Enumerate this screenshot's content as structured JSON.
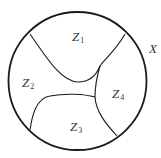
{
  "diagram": {
    "type": "region-partition",
    "outer_set": {
      "label": "X",
      "shape": "circle",
      "center": [
        77.5,
        81
      ],
      "radius": 69,
      "stroke_color": "#1a1a1a"
    },
    "regions": [
      {
        "id": "Z1",
        "base": "Z",
        "sub": "1",
        "position": [
          72,
          32
        ]
      },
      {
        "id": "Z2",
        "base": "Z",
        "sub": "2",
        "position": [
          23,
          78
        ]
      },
      {
        "id": "Z3",
        "base": "Z",
        "sub": "3",
        "position": [
          70,
          122
        ]
      },
      {
        "id": "Z4",
        "base": "Z",
        "sub": "4",
        "position": [
          112,
          89
        ]
      }
    ],
    "boundary_curves": [
      {
        "id": "z1-z2-boundary",
        "path": "M 30 34 C 48 60, 62 82, 78 82 C 90 82, 96 76, 100 66"
      },
      {
        "id": "z1-z4-boundary",
        "path": "M 125 34 C 116 50, 104 60, 100 66"
      },
      {
        "id": "z2-z4-junction-branch",
        "path": "M 100 66 C 97 76, 95 86, 95 97"
      },
      {
        "id": "z2-z3-boundary",
        "path": "M 30 130 C 32 116, 36 98, 50 96 C 66 93, 84 94, 95 97"
      },
      {
        "id": "z3-z4-boundary",
        "path": "M 95 97 C 96 112, 106 124, 117 136"
      }
    ],
    "colors": {
      "line": "#1a1a1a",
      "text": "#333333",
      "background": "#ffffff"
    }
  }
}
